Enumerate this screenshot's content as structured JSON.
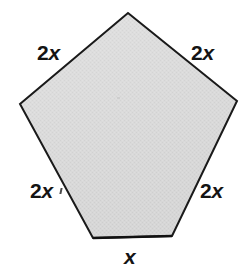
{
  "figure": {
    "background_color": "#ffffff",
    "shape": {
      "name": "pentagon",
      "fill_color": "#dcdcdc",
      "stroke_color": "#1a1a1a",
      "stroke_width": 2,
      "vertices": [
        {
          "name": "apex",
          "x": 128,
          "y": 13
        },
        {
          "name": "right",
          "x": 237,
          "y": 101
        },
        {
          "name": "bottom-right",
          "x": 172,
          "y": 236
        },
        {
          "name": "bottom-left",
          "x": 93,
          "y": 238
        },
        {
          "name": "left",
          "x": 20,
          "y": 104
        }
      ]
    },
    "labels": {
      "top_left": {
        "coefficient": "2",
        "variable": "x",
        "text": "2x"
      },
      "top_right": {
        "coefficient": "2",
        "variable": "x",
        "text": "2x"
      },
      "bottom_left": {
        "coefficient": "2",
        "variable": "x",
        "text": "2x"
      },
      "bottom_right": {
        "coefficient": "2",
        "variable": "x",
        "text": "2x"
      },
      "bottom": {
        "coefficient": "",
        "variable": "x",
        "text": "x"
      }
    }
  }
}
